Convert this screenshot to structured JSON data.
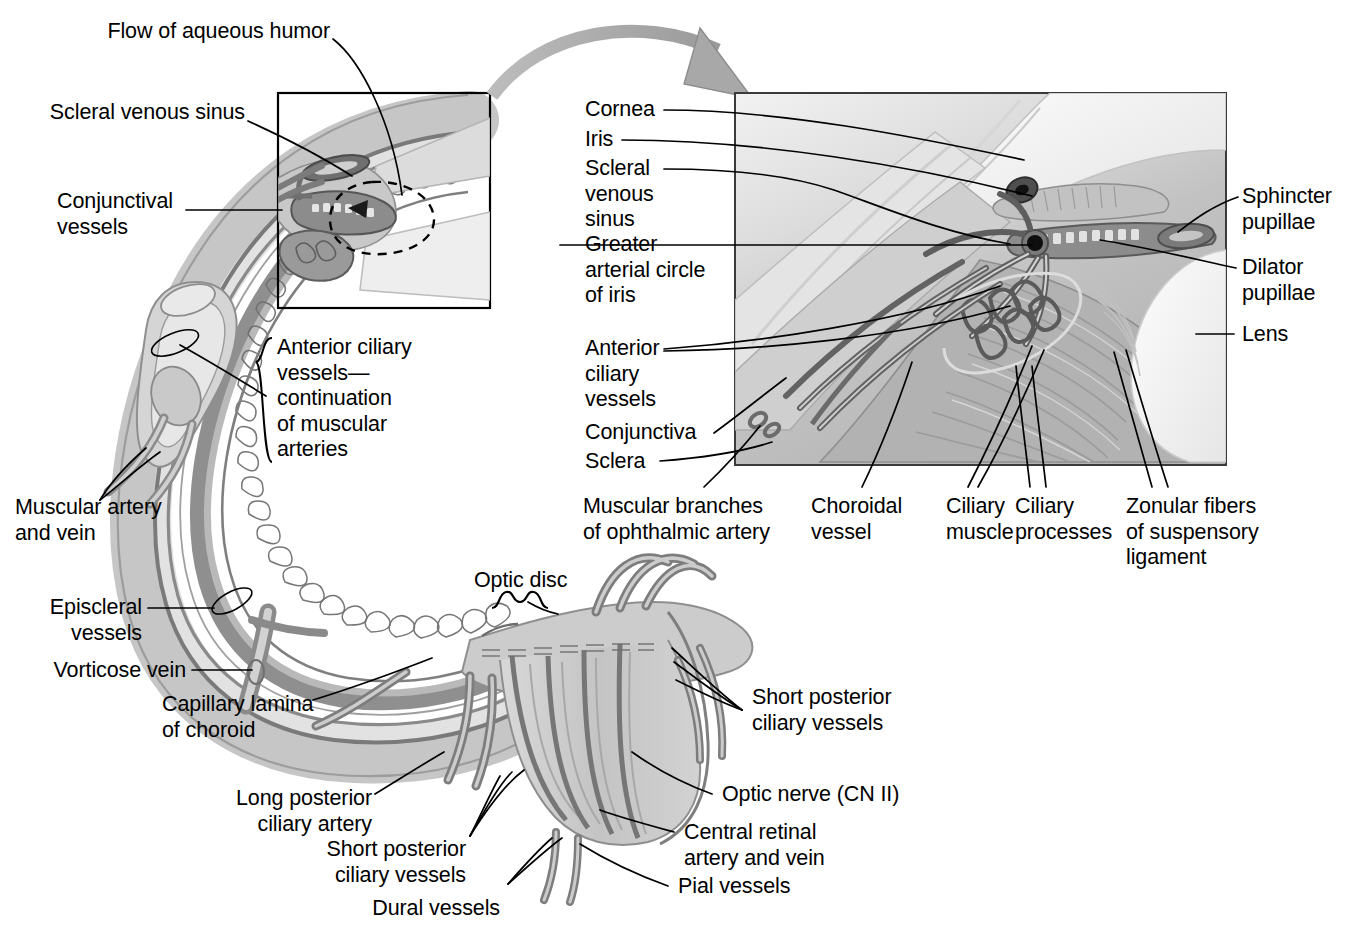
{
  "figure": {
    "kind": "anatomical-illustration"
  },
  "labels": {
    "flow_of_aqueous_humor": "Flow of aqueous humor",
    "scleral_venous_sinus": "Scleral venous sinus",
    "conjunctival_vessels": "Conjunctival\nvessels",
    "anterior_ciliary_brace": "Anterior ciliary\nvessels—\ncontinuation\nof muscular\narteries",
    "muscular_artery_and_vein": "Muscular artery\nand vein",
    "episcleral_vessels": "Episcleral\nvessels",
    "vorticose_vein": "Vorticose vein",
    "capillary_lamina_of_choroid": "Capillary lamina\nof choroid",
    "long_posterior_ciliary_artery": "Long posterior\nciliary artery",
    "short_posterior_ciliary_vessels_left": "Short posterior\nciliary vessels",
    "dural_vessels": "Dural vessels",
    "optic_disc": "Optic disc",
    "short_posterior_ciliary_vessels_right": "Short posterior\nciliary vessels",
    "optic_nerve": "Optic nerve (CN II)",
    "central_retinal_artery_and_vein": "Central retinal\nartery and vein",
    "pial_vessels": "Pial vessels",
    "cornea": "Cornea",
    "iris": "Iris",
    "scleral_venous_sinus_detail": "Scleral\nvenous\nsinus",
    "greater_arterial_circle_of_iris": "Greater\narterial circle\nof iris",
    "anterior_ciliary_vessels_detail": "Anterior\nciliary\nvessels",
    "conjunctiva": "Conjunctiva",
    "sclera": "Sclera",
    "muscular_branches_of_ophthalmic_artery": "Muscular branches\nof ophthalmic artery",
    "choroidal_vessel": "Choroidal\nvessel",
    "ciliary_muscle": "Ciliary\nmuscle",
    "ciliary_processes": "Ciliary\nprocesses",
    "zonular_fibers": "Zonular fibers\nof suspensory\nligament",
    "sphincter_pupillae": "Sphincter\npupillae",
    "dilator_pupillae": "Dilator\npupillae",
    "lens": "Lens"
  },
  "colors": {
    "ink": "#000000",
    "vessel_dark": "#6e6e6e",
    "vessel_mid": "#8d8d8d",
    "tissue_light": "#d6d6d6",
    "tissue_mid": "#bdbdbd",
    "tissue_pale": "#ececec",
    "arrow_fill": "#a8a8a8",
    "panel_bg": "#c9c9c9"
  }
}
